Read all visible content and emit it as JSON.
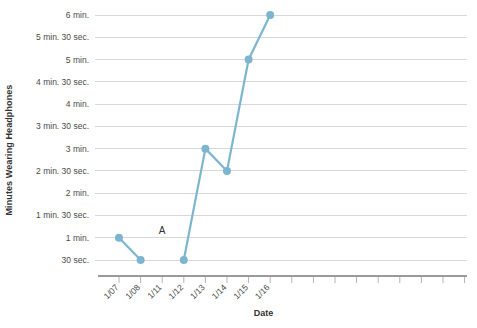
{
  "chart_data": {
    "type": "line",
    "title": "",
    "xlabel": "Date",
    "ylabel": "Minutes Wearing Headphones",
    "categories": [
      "1/07",
      "1/08",
      "1/11",
      "1/12",
      "1/13",
      "1/14",
      "1/15",
      "1/16"
    ],
    "series": [
      {
        "name": "Minutes Wearing Headphones",
        "values": [
          60,
          30,
          null,
          30,
          180,
          150,
          300,
          360
        ],
        "value_labels": [
          "1 min.",
          "30 sec.",
          null,
          "30 sec.",
          "3 min.",
          "2 min. 30 sec.",
          "5 min.",
          "6 min."
        ],
        "color": "#7eb5ce"
      }
    ],
    "ylim": [
      0,
      360
    ],
    "y_tick_values": [
      30,
      60,
      90,
      120,
      150,
      180,
      210,
      240,
      270,
      300,
      330,
      360
    ],
    "y_tick_labels": [
      "30 sec.",
      "1 min.",
      "1 min. 30 sec.",
      "2 min.",
      "2 min. 30 sec.",
      "3 min.",
      "3 min. 30 sec.",
      "4 min.",
      "4 min. 30 sec.",
      "5 min.",
      "5 min. 30 sec.",
      "6 min."
    ],
    "grid": true,
    "legend": false,
    "annotations": [
      {
        "text": "A",
        "x_category": "1/11",
        "y_value": 65
      }
    ],
    "units": "seconds",
    "extra_unlabeled_xticks": 15,
    "axis_color": "#9a9a9a",
    "gridline_color": "#d8d8d8"
  }
}
